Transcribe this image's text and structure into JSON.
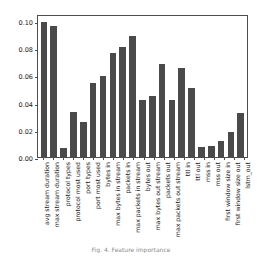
{
  "figure": {
    "caption": "Fig. 4.  Feature importance"
  },
  "chart_data": {
    "type": "bar",
    "title": "",
    "xlabel": "",
    "ylabel": "",
    "ylim": [
      0.0,
      0.105
    ],
    "grid": false,
    "legend": "none",
    "bar_color": "#4a4a4a",
    "yticks": [
      "0.00",
      "0.02",
      "0.04",
      "0.06",
      "0.08",
      "0.10"
    ],
    "ytick_values": [
      0.0,
      0.02,
      0.04,
      0.06,
      0.08,
      0.1
    ],
    "categories": [
      "avg stream duration",
      "max stream duration",
      "protocol types",
      "protocol most used",
      "port types",
      "port most used",
      "bytes in",
      "max bytes in stream",
      "packets in",
      "max packets in stream",
      "bytes out",
      "max bytes out stream",
      "packets out",
      "max packets out stream",
      "ttl in",
      "ttl out",
      "mss in",
      "mss out",
      "first window size in",
      "first window size out",
      "lstm_out"
    ],
    "values": [
      0.0995,
      0.0965,
      0.0065,
      0.033,
      0.0255,
      0.0545,
      0.0595,
      0.0765,
      0.0805,
      0.0885,
      0.0415,
      0.045,
      0.068,
      0.0415,
      0.065,
      0.051,
      0.0077,
      0.008,
      0.0115,
      0.0185,
      0.0325
    ]
  }
}
